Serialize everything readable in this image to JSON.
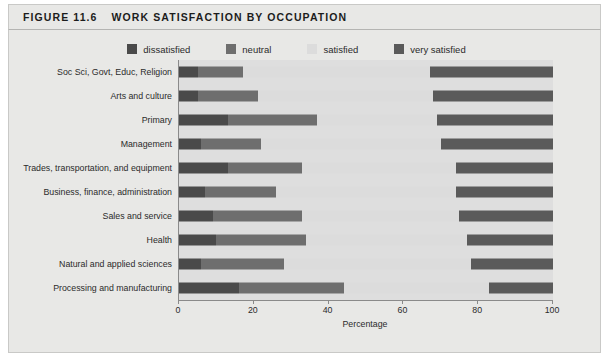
{
  "figure": {
    "number": "FIGURE 11.6",
    "title": "WORK SATISFACTION BY OCCUPATION"
  },
  "colors": {
    "dissatisfied": "#4a4a4a",
    "neutral": "#6e6e6e",
    "satisfied": "#dcdcdc",
    "very_satisfied": "#5a5a5a",
    "plot_background": "#dedede",
    "panel_background": "#e8e8e6",
    "axis": "#8a8a8a"
  },
  "legend": {
    "position": "top-center",
    "items": [
      {
        "label": "dissatisfied",
        "color": "#4a4a4a"
      },
      {
        "label": "neutral",
        "color": "#6e6e6e"
      },
      {
        "label": "satisfied",
        "color": "#dcdcdc"
      },
      {
        "label": "very satisfied",
        "color": "#5a5a5a"
      }
    ]
  },
  "chart_data": {
    "type": "bar",
    "orientation": "horizontal",
    "stacked": true,
    "stack_total": 100,
    "title": "WORK SATISFACTION BY OCCUPATION",
    "xlabel": "Percentage",
    "ylabel": "",
    "xlim": [
      0,
      100
    ],
    "xticks": [
      0,
      20,
      40,
      60,
      80,
      100
    ],
    "xtick_labels": [
      "0",
      "20",
      "40",
      "60",
      "80",
      "100"
    ],
    "grid": false,
    "legend_position": "top-center",
    "categories": [
      "Soc Sci, Govt, Educ, Religion",
      "Arts and culture",
      "Primary",
      "Management",
      "Trades, transportation, and equipment",
      "Business, finance, administration",
      "Sales and service",
      "Health",
      "Natural and applied sciences",
      "Processing and manufacturing"
    ],
    "series": [
      {
        "name": "dissatisfied",
        "color": "#4a4a4a",
        "values": [
          5,
          5,
          13,
          6,
          13,
          7,
          9,
          10,
          6,
          16
        ]
      },
      {
        "name": "neutral",
        "color": "#6e6e6e",
        "values": [
          12,
          16,
          24,
          16,
          20,
          19,
          24,
          24,
          22,
          28
        ]
      },
      {
        "name": "satisfied",
        "color": "#dcdcdc",
        "values": [
          50,
          47,
          32,
          48,
          41,
          48,
          42,
          43,
          50,
          39
        ]
      },
      {
        "name": "very satisfied",
        "color": "#5a5a5a",
        "values": [
          33,
          32,
          31,
          30,
          26,
          26,
          25,
          23,
          22,
          17
        ]
      }
    ]
  }
}
